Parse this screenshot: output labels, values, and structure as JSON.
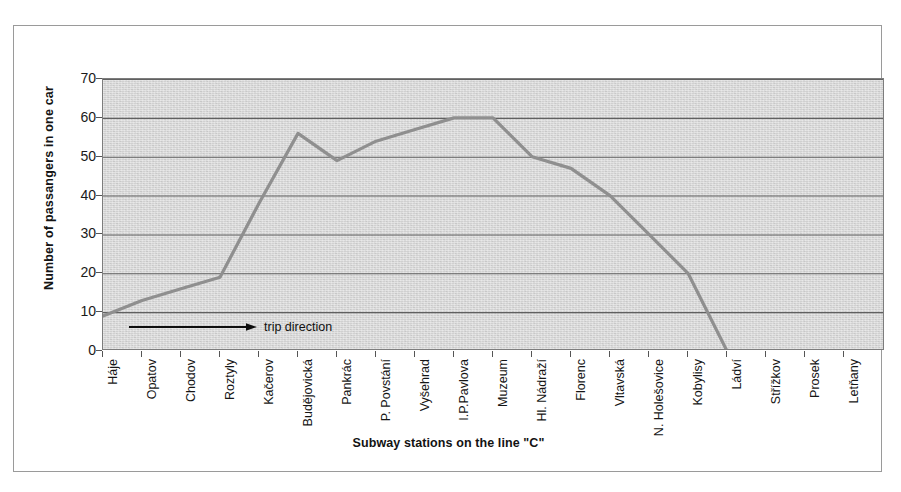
{
  "figure": {
    "top_bleed_text": "",
    "background_color": "#ffffff",
    "plot_background_color": "#d4d4d4",
    "frame_color": "#9a9a9a",
    "series_color": "#8f8f8f",
    "gridline_color": "#606060",
    "annotation_color": "#101010"
  },
  "chart_data": {
    "type": "line",
    "title": "",
    "xlabel": "Subway stations on the line  \"C\"",
    "ylabel": "Number of passangers in one car",
    "ylim": [
      0,
      70
    ],
    "ytick_step": 10,
    "yticks": [
      "70",
      "60",
      "50",
      "40",
      "30",
      "20",
      "10",
      "0"
    ],
    "grid": true,
    "grid_axis": "y",
    "legend": false,
    "categories": [
      "Háje",
      "Opatov",
      "Chodov",
      "Roztyly",
      "Kačerov",
      "Budějovická",
      "Pankrác",
      "P. Povstání",
      "Vyšehrad",
      "I.P.Pavlova",
      "Muzeum",
      "Hl. Nádraží",
      "Florenc",
      "Vltavská",
      "N. Holešovice",
      "Kobylisy",
      "Ládví",
      "Střížkov",
      "Prosek",
      "Letňany"
    ],
    "values": [
      9,
      13,
      16,
      19,
      38,
      56,
      49,
      54,
      57,
      60,
      60,
      50,
      47,
      40,
      30,
      20,
      0,
      null,
      null,
      null
    ],
    "series": [
      {
        "name": "Number of passangers in one car",
        "values": [
          9,
          13,
          16,
          19,
          38,
          56,
          49,
          54,
          57,
          60,
          60,
          50,
          47,
          40,
          30,
          20,
          0,
          null,
          null,
          null
        ]
      }
    ],
    "annotations": [
      {
        "text": "trip direction",
        "type": "arrow-right",
        "value_y": 6
      }
    ]
  }
}
